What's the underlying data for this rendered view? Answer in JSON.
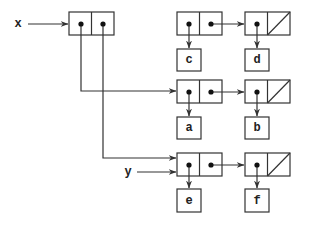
{
  "diagram": {
    "type": "box-and-pointer",
    "variables": [
      {
        "name": "x",
        "points_to": "pair_x"
      },
      {
        "name": "y",
        "points_to": "pair_row3_1"
      }
    ],
    "pairs": [
      {
        "id": "pair_x",
        "car": "pair_row2_1",
        "cdr": "pair_row3_1"
      },
      {
        "id": "pair_row1_1",
        "car": "c",
        "cdr": "pair_row1_2"
      },
      {
        "id": "pair_row1_2",
        "car": "d",
        "cdr": "nil"
      },
      {
        "id": "pair_row2_1",
        "car": "a",
        "cdr": "pair_row2_2"
      },
      {
        "id": "pair_row2_2",
        "car": "b",
        "cdr": "nil"
      },
      {
        "id": "pair_row3_1",
        "car": "e",
        "cdr": "pair_row3_2"
      },
      {
        "id": "pair_row3_2",
        "car": "f",
        "cdr": "nil"
      }
    ],
    "atoms": {
      "c": "c",
      "d": "d",
      "a": "a",
      "b": "b",
      "e": "e",
      "f": "f"
    },
    "labels": {
      "x": "x",
      "y": "y"
    }
  }
}
